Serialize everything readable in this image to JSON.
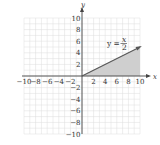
{
  "chart_data": {
    "type": "area",
    "title": "",
    "xlabel": "x",
    "ylabel": "y",
    "xlim": [
      -10,
      10
    ],
    "ylim": [
      -10,
      10
    ],
    "grid": true,
    "x_ticks": [
      "-10",
      "-8",
      "-6",
      "-4",
      "-2",
      "2",
      "4",
      "6",
      "8",
      "10"
    ],
    "y_ticks": [
      "10",
      "8",
      "6",
      "4",
      "2",
      "-2",
      "-4",
      "-6",
      "-8",
      "-10"
    ],
    "series": [
      {
        "name": "y = x/2",
        "x": [
          0,
          10
        ],
        "y": [
          0,
          5
        ]
      }
    ],
    "shaded_region": {
      "description": "region between y=0 and y=x/2 for 0 ≤ x ≤ 10",
      "vertices": [
        [
          0,
          0
        ],
        [
          10,
          0
        ],
        [
          10,
          5
        ]
      ]
    },
    "annotation": {
      "text_left": "y =",
      "numerator": "x",
      "denominator": "2"
    }
  },
  "colors": {
    "grid": "#dcdcdc",
    "axis": "#444444",
    "line": "#555555",
    "shade": "#cfcfcf"
  }
}
